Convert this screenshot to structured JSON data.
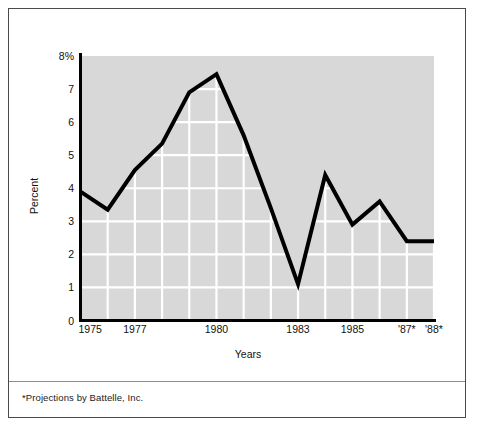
{
  "figure": {
    "footnote": "*Projections by Battelle, Inc."
  },
  "chart_data": {
    "type": "line",
    "title": "",
    "xlabel": "Years",
    "ylabel": "Percent",
    "x": [
      1975,
      1976,
      1977,
      1978,
      1979,
      1980,
      1981,
      1982,
      1983,
      1984,
      1985,
      1986,
      1987,
      1988
    ],
    "values": [
      3.9,
      3.35,
      4.55,
      5.35,
      6.9,
      7.45,
      5.6,
      3.4,
      1.1,
      4.4,
      2.9,
      3.6,
      2.4,
      2.4
    ],
    "categories": [
      "1975",
      "1976",
      "1977",
      "1978",
      "1979",
      "1980",
      "1981",
      "1982",
      "1983",
      "1984",
      "1985",
      "1986",
      "'87*",
      "'88*"
    ],
    "xtick_labels": [
      "1975",
      "1977",
      "1980",
      "1983",
      "1985",
      "'87*",
      "'88*"
    ],
    "xtick_values": [
      1975,
      1977,
      1980,
      1983,
      1985,
      1987,
      1988
    ],
    "ytick_labels": [
      "0",
      "1",
      "2",
      "3",
      "4",
      "5",
      "6",
      "7",
      "8%"
    ],
    "ytick_values": [
      0,
      1,
      2,
      3,
      4,
      5,
      6,
      7,
      8
    ],
    "ylim": [
      0,
      8
    ],
    "xlim": [
      1975,
      1988
    ],
    "grid": true,
    "grid_color": "#ffffff",
    "grid_clipped_under_curve": true,
    "plot_background": "#d8d8d8",
    "line_color": "#000000",
    "legend": "none"
  }
}
